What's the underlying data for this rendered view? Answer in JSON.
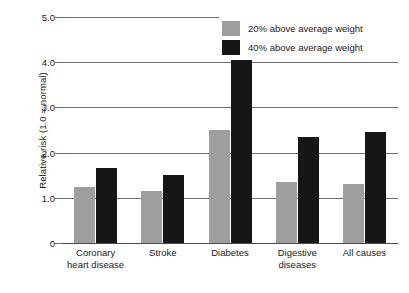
{
  "chart_data": {
    "type": "bar",
    "title": "",
    "xlabel": "",
    "ylabel": "Relative risk (1.0 = normal)",
    "categories": [
      "Coronary\nheart disease",
      "Stroke",
      "Diabetes",
      "Digestive\ndiseases",
      "All causes"
    ],
    "series": [
      {
        "name": "20% above average weight",
        "color": "#9e9e9e",
        "values": [
          1.25,
          1.15,
          2.5,
          1.35,
          1.3
        ]
      },
      {
        "name": "40% above average weight",
        "color": "#161616",
        "values": [
          1.65,
          1.5,
          5.3,
          2.35,
          2.45
        ]
      }
    ],
    "ylim": [
      0,
      5.0
    ],
    "yticks": [
      "0",
      "1.0",
      "2.0",
      "3.0",
      "4.0",
      "5.0"
    ],
    "ytick_values": [
      0,
      1.0,
      2.0,
      3.0,
      4.0,
      5.0
    ],
    "grid": true,
    "legend_position": "top-right"
  },
  "legend": {
    "items": [
      {
        "label": "20% above average weight",
        "color": "#9e9e9e"
      },
      {
        "label": "40% above average weight",
        "color": "#161616"
      }
    ]
  }
}
